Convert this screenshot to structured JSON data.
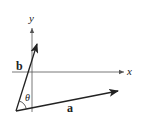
{
  "diagram": {
    "type": "vector-angle-diagram",
    "axes": {
      "x_label": "x",
      "y_label": "y"
    },
    "vectors": [
      {
        "name": "a",
        "label": "a",
        "tail": [
          16,
          111
        ],
        "head": [
          118,
          91
        ]
      },
      {
        "name": "b",
        "label": "b",
        "tail": [
          16,
          111
        ],
        "head": [
          36,
          44
        ]
      }
    ],
    "angle": {
      "label": "θ",
      "between": [
        "a",
        "b"
      ]
    },
    "colors": {
      "stroke": "#2a2a2a",
      "axis": "#555555",
      "background": "#ffffff"
    }
  }
}
